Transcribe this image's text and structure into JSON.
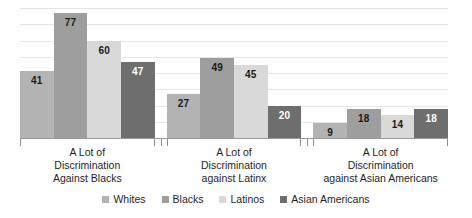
{
  "chart_data": {
    "type": "bar",
    "title": "",
    "subtitle": "",
    "xlabel": "",
    "ylabel": "",
    "ylim": [
      0,
      80
    ],
    "grid": true,
    "gridline_values": [
      10,
      20,
      30,
      40,
      50,
      60,
      70,
      80
    ],
    "legend_position": "bottom",
    "categories": [
      "A Lot of\nDiscrimination\nAgainst Blacks",
      "A Lot of\nDiscrimination\nagainst Latinx",
      "A Lot of\nDiscrimination\nagainst Asian Americans"
    ],
    "category_lines": [
      [
        "A Lot of",
        "Discrimination",
        "Against Blacks"
      ],
      [
        "A Lot of",
        "Discrimination",
        "against Latinx"
      ],
      [
        "A Lot of",
        "Discrimination",
        "against Asian Americans"
      ]
    ],
    "series": [
      {
        "name": "Whites",
        "color": "#b3b3b3",
        "label_color": "dark",
        "values": [
          41,
          27,
          9
        ]
      },
      {
        "name": "Blacks",
        "color": "#9e9e9e",
        "label_color": "dark",
        "values": [
          77,
          49,
          18
        ]
      },
      {
        "name": "Latinos",
        "color": "#d9d9d9",
        "label_color": "dark",
        "values": [
          60,
          45,
          14
        ]
      },
      {
        "name": "Asian Americans",
        "color": "#6e6e6e",
        "label_color": "light",
        "values": [
          47,
          20,
          18
        ]
      }
    ]
  },
  "legend": {
    "items": [
      {
        "label": "Whites",
        "color": "#b3b3b3"
      },
      {
        "label": "Blacks",
        "color": "#9e9e9e"
      },
      {
        "label": "Latinos",
        "color": "#d9d9d9"
      },
      {
        "label": "Asian Americans",
        "color": "#6e6e6e"
      }
    ]
  },
  "colors": {
    "gridline": "#e6e6e6",
    "axis": "#9a9a9a",
    "bracket": "#8d8d8d",
    "text": "#1f1f1f",
    "label_dark": "#1a1a1a",
    "label_light": "#ffffff",
    "background": "#ffffff"
  }
}
